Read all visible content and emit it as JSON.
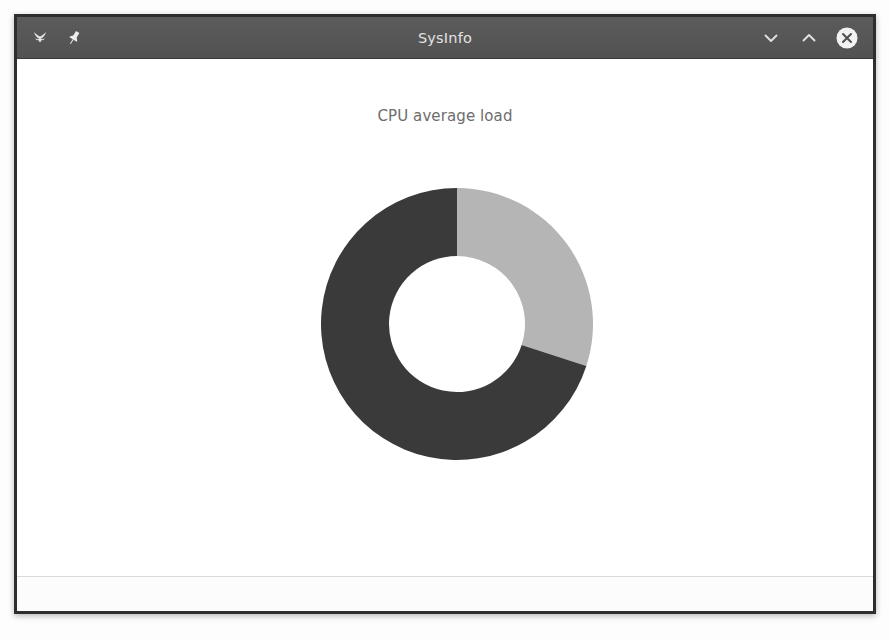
{
  "window": {
    "title": "SysInfo",
    "icons": {
      "app": "app-butterfly-icon",
      "pin": "pushpin-icon",
      "minimize": "chevron-down-icon",
      "maximize": "chevron-up-icon",
      "close": "close-circle-icon"
    },
    "controls": {
      "minimize_label": "",
      "maximize_label": "",
      "close_label": ""
    }
  },
  "chart_data": {
    "type": "pie",
    "variant": "donut",
    "title": "CPU average load",
    "categories": [
      "Load",
      "Idle"
    ],
    "values": [
      30,
      70
    ],
    "colors": [
      "#b5b5b5",
      "#3a3a3a"
    ],
    "start_angle_deg": 0,
    "direction": "clockwise",
    "inner_radius_ratio": 0.5,
    "legend": "none",
    "grid": false,
    "xlabel": "",
    "ylabel": "",
    "background": "#ffffff"
  },
  "theme": {
    "titlebar_bg": "#565656",
    "titlebar_fg": "#e3e3e3",
    "window_bg": "#ffffff",
    "frame_border": "#2e2e2e",
    "chart_title_color": "#6d6d6d"
  }
}
